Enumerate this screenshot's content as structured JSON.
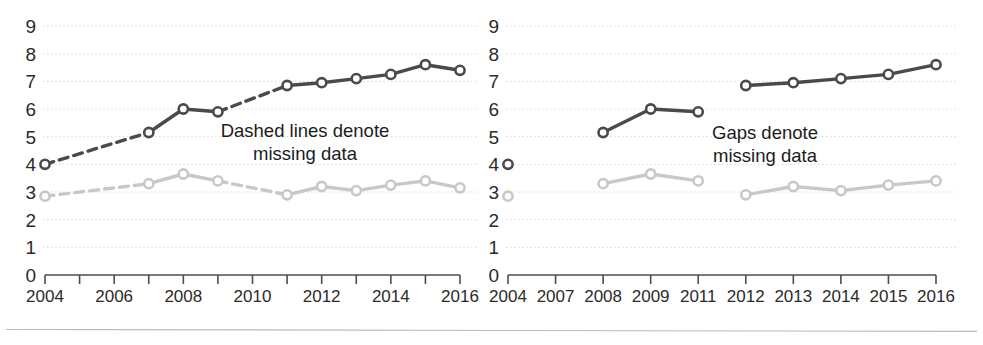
{
  "figure": {
    "background_color": "#ffffff",
    "series_colors": {
      "dark": "#4a4a4a",
      "light": "#c8c8c8"
    },
    "grid_color": "#d8d8d8",
    "axis_color": "#4d4d4d"
  },
  "panels": [
    {
      "id": "left",
      "annotation_line1": "Dashed lines denote",
      "annotation_line2": "missing data",
      "chart_data": {
        "type": "line",
        "title": "",
        "xlabel": "",
        "ylabel": "",
        "ylim": [
          0,
          9
        ],
        "yticks": [
          0,
          1,
          2,
          3,
          4,
          5,
          6,
          7,
          8,
          9
        ],
        "ytick_labels": [
          "0",
          "1",
          "2",
          "3",
          "4",
          "5",
          "6",
          "7",
          "8",
          "9"
        ],
        "grid": true,
        "legend": "none",
        "x_axis_type": "numeric-year",
        "xlim": [
          2004,
          2016
        ],
        "xticks": [
          2004,
          2005,
          2006,
          2007,
          2008,
          2009,
          2010,
          2011,
          2012,
          2013,
          2014,
          2015,
          2016
        ],
        "xtick_labels": [
          "2004",
          "",
          "2006",
          "",
          "2008",
          "",
          "2010",
          "",
          "2012",
          "",
          "2014",
          "",
          "2016"
        ],
        "series": [
          {
            "name": "dark",
            "color": "#4a4a4a",
            "x": [
              2004,
              2007,
              2008,
              2009,
              2011,
              2012,
              2013,
              2014,
              2015,
              2016
            ],
            "values": [
              4.0,
              5.15,
              6.0,
              5.9,
              6.85,
              6.95,
              7.1,
              7.25,
              7.6,
              7.4
            ],
            "dashed_segments": [
              [
                2004,
                2007
              ],
              [
                2009,
                2011
              ]
            ]
          },
          {
            "name": "light",
            "color": "#c8c8c8",
            "x": [
              2004,
              2007,
              2008,
              2009,
              2011,
              2012,
              2013,
              2014,
              2015,
              2016
            ],
            "values": [
              2.85,
              3.3,
              3.65,
              3.4,
              2.9,
              3.2,
              3.05,
              3.25,
              3.4,
              3.15
            ],
            "dashed_segments": [
              [
                2004,
                2007
              ],
              [
                2009,
                2011
              ]
            ]
          }
        ]
      }
    },
    {
      "id": "right",
      "annotation_line1": "Gaps denote",
      "annotation_line2": "missing data",
      "chart_data": {
        "type": "line",
        "title": "",
        "xlabel": "",
        "ylabel": "",
        "ylim": [
          0,
          9
        ],
        "yticks": [
          0,
          1,
          2,
          3,
          4,
          5,
          6,
          7,
          8,
          9
        ],
        "ytick_labels": [
          "0",
          "1",
          "2",
          "3",
          "4",
          "5",
          "6",
          "7",
          "8",
          "9"
        ],
        "grid": true,
        "legend": "none",
        "x_axis_type": "categorical",
        "categories": [
          "2004",
          "2007",
          "2008",
          "2009",
          "2011",
          "2012",
          "2013",
          "2014",
          "2015",
          "2016"
        ],
        "series": [
          {
            "name": "dark",
            "color": "#4a4a4a",
            "values": [
              4.0,
              null,
              5.15,
              6.0,
              5.9,
              6.85,
              6.95,
              7.1,
              7.25,
              7.6,
              7.4
            ],
            "groups": [
              {
                "categories": [
                  "2004"
                ],
                "values": [
                  4.0
                ]
              },
              {
                "categories": [
                  "2008",
                  "2009",
                  "2011"
                ],
                "values": [
                  5.15,
                  6.0,
                  5.9
                ]
              },
              {
                "categories": [
                  "2012",
                  "2013",
                  "2014",
                  "2015",
                  "2016"
                ],
                "values": [
                  6.85,
                  6.95,
                  7.1,
                  7.25,
                  7.6,
                  7.4
                ]
              }
            ]
          },
          {
            "name": "light",
            "color": "#c8c8c8",
            "groups": [
              {
                "categories": [
                  "2004"
                ],
                "values": [
                  2.85
                ]
              },
              {
                "categories": [
                  "2008",
                  "2009",
                  "2011"
                ],
                "values": [
                  3.3,
                  3.65,
                  3.4
                ]
              },
              {
                "categories": [
                  "2012",
                  "2013",
                  "2014",
                  "2015",
                  "2016"
                ],
                "values": [
                  2.9,
                  3.2,
                  3.05,
                  3.25,
                  3.4,
                  3.15
                ]
              }
            ]
          }
        ]
      }
    }
  ]
}
